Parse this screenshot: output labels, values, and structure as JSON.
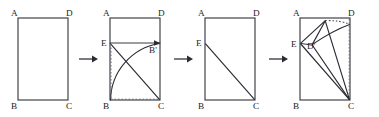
{
  "figure": {
    "width": 379,
    "height": 117,
    "background_color": "#ffffff",
    "line_color": "#2b2b33",
    "dotted_color": "#6d6d78"
  },
  "panels": [
    {
      "id": "panel-1",
      "caption": "Original rectangle ABCD",
      "origin": {
        "x": 18,
        "y": 18
      },
      "rect": {
        "x": 18,
        "y": 18,
        "width": 50,
        "height": 82
      },
      "labels": [
        {
          "name": "label-A",
          "text": "A",
          "x": 11,
          "y": 16
        },
        {
          "name": "label-D",
          "text": "D",
          "x": 68,
          "y": 16
        },
        {
          "name": "label-B",
          "text": "B",
          "x": 11,
          "y": 107
        },
        {
          "name": "label-C",
          "text": "C",
          "x": 68,
          "y": 107
        }
      ]
    },
    {
      "id": "panel-2",
      "caption": "Fold B onto side DC to locate B-prime; crease through E",
      "origin": {
        "x": 110,
        "y": 18
      },
      "rect": {
        "x": 110,
        "y": 18,
        "width": 50,
        "height": 82
      },
      "points": {
        "A": {
          "x": 110,
          "y": 18
        },
        "D": {
          "x": 160,
          "y": 18
        },
        "B": {
          "x": 110,
          "y": 100
        },
        "C": {
          "x": 160,
          "y": 100
        },
        "E": {
          "x": 110,
          "y": 43
        },
        "Bprime": {
          "x": 160,
          "y": 43
        }
      },
      "labels": [
        {
          "name": "label-A",
          "text": "A",
          "x": 103,
          "y": 16
        },
        {
          "name": "label-D",
          "text": "D",
          "x": 160,
          "y": 16
        },
        {
          "name": "label-B",
          "text": "B",
          "x": 103,
          "y": 107
        },
        {
          "name": "label-C",
          "text": "C",
          "x": 160,
          "y": 107
        },
        {
          "name": "label-E",
          "text": "E",
          "x": 102,
          "y": 46
        },
        {
          "name": "label-B-prime",
          "text": "B'",
          "x": 150,
          "y": 53
        }
      ]
    },
    {
      "id": "panel-3",
      "caption": "Unfolded rectangle showing crease segment EC",
      "origin": {
        "x": 205,
        "y": 18
      },
      "rect": {
        "x": 205,
        "y": 18,
        "width": 50,
        "height": 82
      },
      "points": {
        "A": {
          "x": 205,
          "y": 18
        },
        "D": {
          "x": 255,
          "y": 18
        },
        "B": {
          "x": 205,
          "y": 100
        },
        "C": {
          "x": 255,
          "y": 100
        },
        "E": {
          "x": 205,
          "y": 43
        }
      },
      "labels": [
        {
          "name": "label-A",
          "text": "A",
          "x": 198,
          "y": 16
        },
        {
          "name": "label-D",
          "text": "D",
          "x": 255,
          "y": 16
        },
        {
          "name": "label-B",
          "text": "B",
          "x": 198,
          "y": 107
        },
        {
          "name": "label-C",
          "text": "C",
          "x": 255,
          "y": 107
        },
        {
          "name": "label-E",
          "text": "E",
          "x": 197,
          "y": 46
        }
      ]
    },
    {
      "id": "panel-4",
      "caption": "Fold D onto the crease line to locate D-prime near E",
      "origin": {
        "x": 300,
        "y": 18
      },
      "rect": {
        "x": 300,
        "y": 18,
        "width": 50,
        "height": 82
      },
      "points": {
        "A": {
          "x": 300,
          "y": 18
        },
        "D": {
          "x": 350,
          "y": 18
        },
        "B": {
          "x": 300,
          "y": 100
        },
        "C": {
          "x": 350,
          "y": 100
        },
        "E": {
          "x": 300,
          "y": 43
        },
        "Dprime": {
          "x": 311,
          "y": 45
        },
        "foldvertex": {
          "x": 325,
          "y": 21
        }
      },
      "labels": [
        {
          "name": "label-A",
          "text": "A",
          "x": 293,
          "y": 16
        },
        {
          "name": "label-D",
          "text": "D",
          "x": 350,
          "y": 16
        },
        {
          "name": "label-B",
          "text": "B",
          "x": 293,
          "y": 107
        },
        {
          "name": "label-C",
          "text": "C",
          "x": 350,
          "y": 107
        },
        {
          "name": "label-E",
          "text": "E",
          "x": 292,
          "y": 46
        },
        {
          "name": "label-D-prime",
          "text": "D'",
          "x": 308,
          "y": 48
        }
      ]
    }
  ],
  "arrows": [
    {
      "name": "arrow-1",
      "x1": 79,
      "x2": 97,
      "y": 59
    },
    {
      "name": "arrow-2",
      "x1": 174,
      "x2": 192,
      "y": 59
    },
    {
      "name": "arrow-3",
      "x1": 269,
      "x2": 287,
      "y": 59
    }
  ]
}
